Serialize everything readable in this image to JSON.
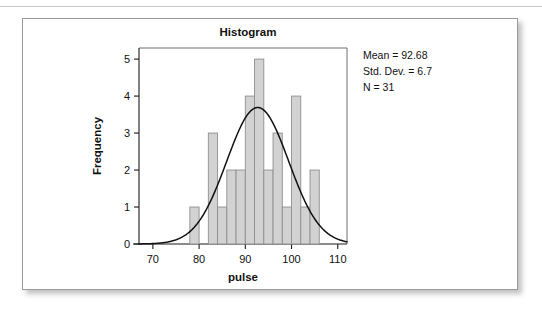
{
  "figure": {
    "title": "Histogram",
    "stats": {
      "mean_label": "Mean = 92.68",
      "stddev_label": "Std. Dev. = 6.7",
      "n_label": "N = 31"
    }
  },
  "chart_data": {
    "type": "bar",
    "title": "Histogram",
    "xlabel": "pulse",
    "ylabel": "Frequency",
    "xlim": [
      67,
      112
    ],
    "ylim": [
      0,
      5.3
    ],
    "xticks": [
      70,
      80,
      90,
      100,
      110
    ],
    "yticks": [
      0,
      1,
      2,
      3,
      4,
      5
    ],
    "xtick_labels": [
      "70",
      "80",
      "90",
      "100",
      "110"
    ],
    "ytick_labels": [
      "0",
      "1",
      "2",
      "3",
      "4",
      "5"
    ],
    "grid": false,
    "legend": false,
    "bin_width": 2,
    "bin_starts": [
      78,
      80,
      82,
      84,
      86,
      88,
      90,
      92,
      94,
      96,
      98,
      100,
      102,
      104
    ],
    "categories": [
      "78-80",
      "80-82",
      "82-84",
      "84-86",
      "86-88",
      "88-90",
      "90-92",
      "92-94",
      "94-96",
      "96-98",
      "98-100",
      "100-102",
      "102-104",
      "104-106"
    ],
    "values": [
      1,
      0,
      3,
      1,
      2,
      2,
      4,
      5,
      2,
      3,
      1,
      4,
      1,
      2
    ],
    "overlay": {
      "type": "normal-curve",
      "mean": 92.68,
      "std_dev": 6.7,
      "n": 31,
      "peak_value": 3.7
    },
    "annotations": [
      "Mean = 92.68",
      "Std. Dev. = 6.7",
      "N = 31"
    ]
  }
}
